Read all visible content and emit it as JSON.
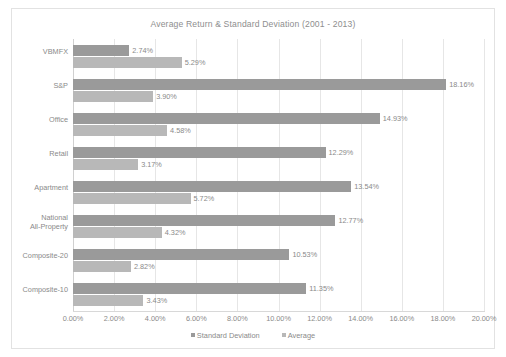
{
  "chart_data": {
    "type": "bar",
    "orientation": "horizontal",
    "title": "Average Return & Standard Deviation (2001 - 2013)",
    "xlabel": "",
    "ylabel": "",
    "xlim": [
      0,
      20
    ],
    "grid": true,
    "legend_position": "bottom",
    "categories": [
      "VBMFX",
      "S&P",
      "Office",
      "Retail",
      "Apartment",
      "National All-Property",
      "Composite-20",
      "Composite-10"
    ],
    "category_labels": [
      [
        "VBMFX"
      ],
      [
        "S&P"
      ],
      [
        "Office"
      ],
      [
        "Retail"
      ],
      [
        "Apartment"
      ],
      [
        "National",
        "All-Property"
      ],
      [
        "Composite-20"
      ],
      [
        "Composite-10"
      ]
    ],
    "series": [
      {
        "name": "Standard Deviation",
        "color": "#9a9a9a",
        "values": [
          2.74,
          18.16,
          14.93,
          12.29,
          13.54,
          12.77,
          10.53,
          11.35
        ],
        "labels": [
          "2.74%",
          "18.16%",
          "14.93%",
          "12.29%",
          "13.54%",
          "12.77%",
          "10.53%",
          "11.35%"
        ]
      },
      {
        "name": "Average",
        "color": "#b8b8b8",
        "values": [
          5.29,
          3.9,
          4.58,
          3.17,
          5.72,
          4.32,
          2.82,
          3.43
        ],
        "labels": [
          "5.29%",
          "3.90%",
          "4.58%",
          "3.17%",
          "5.72%",
          "4.32%",
          "2.82%",
          "3.43%"
        ]
      }
    ],
    "x_ticks": [
      0,
      2,
      4,
      6,
      8,
      10,
      12,
      14,
      16,
      18,
      20
    ],
    "x_tick_labels": [
      "0.00%",
      "2.00%",
      "4.00%",
      "6.00%",
      "8.00%",
      "10.00%",
      "12.00%",
      "14.00%",
      "16.00%",
      "18.00%",
      "20.00%"
    ]
  },
  "legend": [
    {
      "label": "Standard Deviation",
      "color": "#9a9a9a"
    },
    {
      "label": "Average",
      "color": "#b8b8b8"
    }
  ],
  "colors": {
    "standard_deviation": "#9a9a9a",
    "average": "#b8b8b8",
    "gridline": "#e6e6e6",
    "text": "#8a8a8a",
    "frame": "#e2e2e2"
  }
}
